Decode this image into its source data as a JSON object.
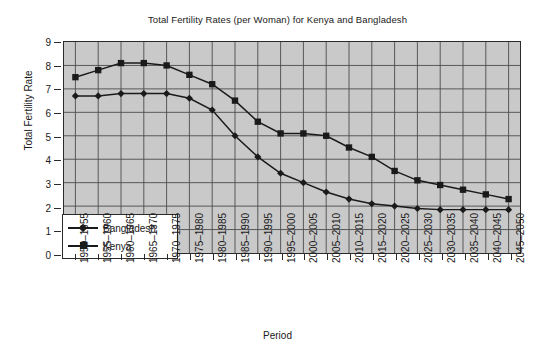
{
  "chart_data": {
    "type": "line",
    "title": "Total Fertility Rates (per Woman) for Kenya and Bangladesh",
    "xlabel": "Period",
    "ylabel": "Total Fertility Rate",
    "ylim": [
      0,
      9
    ],
    "yticks": [
      0,
      1,
      2,
      3,
      4,
      5,
      6,
      7,
      8,
      9
    ],
    "grid": true,
    "legend_position": "inside-bottom-left",
    "categories": [
      "1950–1955",
      "1955–1960",
      "1960–1965",
      "1965–1970",
      "1970–1975",
      "1975–1980",
      "1980–1985",
      "1985–1990",
      "1990–1995",
      "1995–2000",
      "2000–2005",
      "2005–2010",
      "2010–2015",
      "2015–2020",
      "2020–2025",
      "2025–2030",
      "2030–2035",
      "2035–2040",
      "2040–2045",
      "2045–2050"
    ],
    "series": [
      {
        "name": "Bangladesh",
        "marker": "diamond",
        "color": "#1a1a1a",
        "values": [
          6.7,
          6.7,
          6.8,
          6.8,
          6.8,
          6.6,
          6.1,
          5.0,
          4.1,
          3.4,
          3.0,
          2.6,
          2.3,
          2.1,
          2.0,
          1.9,
          1.85,
          1.85,
          1.85,
          1.85
        ]
      },
      {
        "name": "Kenya",
        "marker": "square",
        "color": "#1a1a1a",
        "values": [
          7.5,
          7.8,
          8.1,
          8.1,
          8.0,
          7.6,
          7.2,
          6.5,
          5.6,
          5.1,
          5.1,
          5.0,
          4.5,
          4.1,
          3.5,
          3.1,
          2.9,
          2.7,
          2.5,
          2.3
        ]
      }
    ]
  },
  "legend": {
    "items": [
      {
        "label": "Bangladesh"
      },
      {
        "label": "Kenya"
      }
    ]
  }
}
